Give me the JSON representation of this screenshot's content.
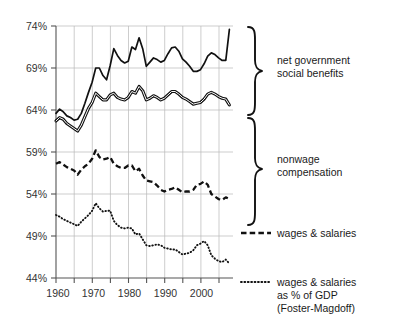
{
  "chart_data": {
    "type": "line",
    "title": "",
    "xlabel": "",
    "ylabel": "",
    "xlim": [
      1959,
      2008
    ],
    "ylim": [
      44,
      74
    ],
    "grid": true,
    "y_ticks": [
      44,
      49,
      54,
      59,
      64,
      69,
      74
    ],
    "y_tick_labels": [
      "44%",
      "49%",
      "54%",
      "59%",
      "64%",
      "69%",
      "74%"
    ],
    "x_ticks": [
      1960,
      1965,
      1970,
      1975,
      1980,
      1985,
      1990,
      1995,
      2000,
      2005
    ],
    "x_tick_labels": [
      "1960",
      "",
      "1970",
      "",
      "1980",
      "",
      "1990",
      "",
      "2000",
      ""
    ],
    "legend_position": "right",
    "x": [
      1959,
      1960,
      1961,
      1962,
      1963,
      1964,
      1965,
      1966,
      1967,
      1968,
      1969,
      1970,
      1971,
      1972,
      1973,
      1974,
      1975,
      1976,
      1977,
      1978,
      1979,
      1980,
      1981,
      1982,
      1983,
      1984,
      1985,
      1986,
      1987,
      1988,
      1989,
      1990,
      1991,
      1992,
      1993,
      1994,
      1995,
      1996,
      1997,
      1998,
      1999,
      2000,
      2001,
      2002,
      2003,
      2004,
      2005,
      2006,
      2007
    ],
    "series": [
      {
        "name": "net government social benefits",
        "style": "solid-thick",
        "values": [
          63.6,
          64.1,
          63.8,
          63.3,
          63.1,
          62.8,
          62.9,
          63.6,
          64.8,
          66.1,
          67.3,
          69.0,
          69.0,
          68.1,
          67.6,
          69.3,
          71.3,
          70.5,
          69.9,
          69.6,
          69.8,
          71.5,
          71.2,
          72.6,
          71.3,
          69.2,
          69.7,
          70.2,
          70.0,
          69.7,
          69.9,
          70.7,
          71.4,
          71.5,
          71.0,
          70.1,
          69.7,
          69.2,
          68.6,
          68.6,
          68.8,
          69.5,
          70.4,
          70.8,
          70.6,
          70.2,
          69.9,
          69.9,
          73.6
        ]
      },
      {
        "name": "nonwage compensation (upper bound of band)",
        "style": "double-line",
        "values": [
          62.7,
          63.1,
          62.9,
          62.4,
          62.1,
          61.8,
          61.5,
          62.2,
          63.2,
          64.2,
          64.9,
          66.0,
          65.6,
          65.2,
          65.2,
          65.8,
          66.0,
          65.5,
          65.3,
          65.2,
          65.5,
          66.2,
          66.0,
          66.8,
          66.3,
          65.2,
          65.4,
          65.7,
          65.5,
          65.2,
          65.4,
          65.8,
          66.2,
          66.2,
          65.9,
          65.5,
          65.3,
          65.0,
          64.7,
          64.8,
          64.9,
          65.3,
          65.9,
          66.1,
          65.9,
          65.6,
          65.4,
          65.3,
          64.6
        ]
      },
      {
        "name": "wages & salaries",
        "style": "dashed",
        "values": [
          57.6,
          57.8,
          57.5,
          57.2,
          57.0,
          56.8,
          56.3,
          56.9,
          57.3,
          57.6,
          58.2,
          59.2,
          58.4,
          58.1,
          58.2,
          58.4,
          57.6,
          57.3,
          57.1,
          57.1,
          57.4,
          57.4,
          56.7,
          57.0,
          56.2,
          55.6,
          55.5,
          55.4,
          55.0,
          54.5,
          54.3,
          54.5,
          54.6,
          54.8,
          54.5,
          54.2,
          54.3,
          54.3,
          54.5,
          55.1,
          55.2,
          55.5,
          55.1,
          54.0,
          53.7,
          53.4,
          53.3,
          53.6,
          53.4
        ]
      },
      {
        "name": "wages & salaries as % of GDP (Foster-Magdoff)",
        "style": "dotted",
        "values": [
          51.5,
          51.3,
          51.0,
          50.8,
          50.6,
          50.4,
          50.2,
          50.7,
          51.1,
          51.5,
          52.0,
          52.9,
          52.3,
          51.9,
          52.0,
          52.0,
          50.8,
          50.3,
          50.0,
          49.9,
          50.0,
          49.9,
          49.2,
          49.3,
          48.6,
          47.9,
          47.8,
          47.9,
          48.0,
          47.9,
          47.6,
          47.5,
          47.4,
          47.4,
          47.1,
          46.8,
          46.9,
          47.0,
          47.3,
          47.9,
          48.1,
          48.4,
          47.9,
          46.7,
          46.3,
          46.0,
          45.9,
          46.2,
          45.7
        ]
      }
    ],
    "annotations": [
      {
        "id": "brace-top",
        "label": "net government\nsocial benefits",
        "line1": "net government",
        "line2": "social benefits"
      },
      {
        "id": "brace-mid",
        "label": "nonwage\ncompensation",
        "line1": "nonwage",
        "line2": "compensation"
      }
    ],
    "legend_entries": [
      {
        "swatch": "dashed",
        "line1": "wages & salaries",
        "line2": "",
        "line3": ""
      },
      {
        "swatch": "dotted",
        "line1": "wages & salaries",
        "line2": "as % of GDP",
        "line3": "(Foster-Magdoff)"
      }
    ]
  }
}
